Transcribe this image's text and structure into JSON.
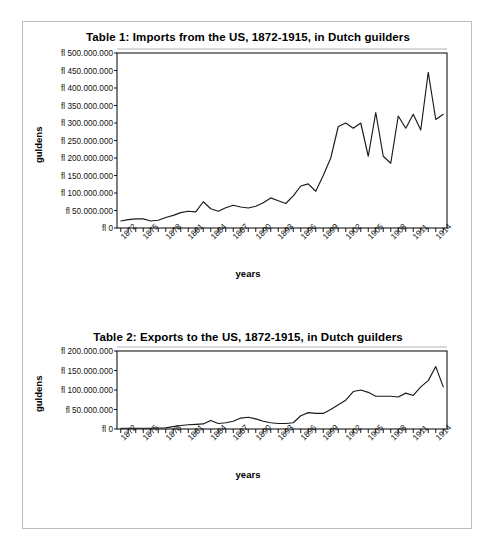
{
  "document": {
    "scan_artifact_text": "· · · ·",
    "figure_border_color": "#b9bfc6"
  },
  "charts": [
    {
      "id": "imports",
      "title": "Table 1: Imports from the US, 1872-1915, in Dutch guilders",
      "xlabel": "years",
      "ylabel": "guldens",
      "y_ticks": [
        "fl 0",
        "fl 50.000.000",
        "fl 100.000.000",
        "fl 150.000.000",
        "fl 200.000.000",
        "fl 250.000.000",
        "fl 300.000.000",
        "fl 350.000.000",
        "fl 400.000.000",
        "fl 450.000.000",
        "fl 500.000.000"
      ],
      "x_ticks": [
        "1872",
        "1875",
        "1878",
        "1881",
        "1884",
        "1887",
        "1890",
        "1893",
        "1896",
        "1899",
        "1902",
        "1905",
        "1908",
        "1911",
        "1914"
      ]
    },
    {
      "id": "exports",
      "title": "Table 2: Exports to the US, 1872-1915, in Dutch guilders",
      "xlabel": "years",
      "ylabel": "guldens",
      "y_ticks": [
        "fl 0",
        "fl 50.000.000",
        "fl 100.000.000",
        "fl 150.000.000",
        "fl 200.000.000"
      ],
      "x_ticks": [
        "1872",
        "1875",
        "1878",
        "1881",
        "1884",
        "1887",
        "1890",
        "1893",
        "1896",
        "1899",
        "1902",
        "1905",
        "1908",
        "1911",
        "1914"
      ]
    }
  ],
  "chart_data": [
    {
      "type": "line",
      "id": "imports",
      "title": "Table 1: Imports from the US, 1872-1915, in Dutch guilders",
      "xlabel": "years",
      "ylabel": "guldens",
      "currency_prefix": "fl",
      "grid": false,
      "legend": "none",
      "ylim": [
        0,
        500000000
      ],
      "ytick_step": 50000000,
      "xlim": [
        1872,
        1915
      ],
      "xtick_step": 1,
      "xtick_label_step": 3,
      "xtick_label_rotation": -45,
      "x": [
        1872,
        1873,
        1874,
        1875,
        1876,
        1877,
        1878,
        1879,
        1880,
        1881,
        1882,
        1883,
        1884,
        1885,
        1886,
        1887,
        1888,
        1889,
        1890,
        1891,
        1892,
        1893,
        1894,
        1895,
        1896,
        1897,
        1898,
        1899,
        1900,
        1901,
        1902,
        1903,
        1904,
        1905,
        1906,
        1907,
        1908,
        1909,
        1910,
        1911,
        1912,
        1913,
        1914,
        1915
      ],
      "values": [
        20000000,
        24000000,
        26000000,
        26000000,
        20000000,
        22000000,
        30000000,
        36000000,
        44000000,
        48000000,
        46000000,
        75000000,
        55000000,
        48000000,
        58000000,
        65000000,
        60000000,
        57000000,
        62000000,
        72000000,
        86000000,
        78000000,
        70000000,
        92000000,
        120000000,
        126000000,
        105000000,
        150000000,
        200000000,
        290000000,
        300000000,
        285000000,
        300000000,
        205000000,
        330000000,
        205000000,
        185000000,
        320000000,
        285000000,
        325000000,
        280000000,
        445000000,
        310000000,
        325000000
      ]
    },
    {
      "type": "line",
      "id": "exports",
      "title": "Table 2: Exports to the US, 1872-1915, in Dutch guilders",
      "xlabel": "years",
      "ylabel": "guldens",
      "currency_prefix": "fl",
      "grid": false,
      "legend": "none",
      "ylim": [
        0,
        200000000
      ],
      "ytick_step": 50000000,
      "xlim": [
        1872,
        1915
      ],
      "xtick_step": 1,
      "xtick_label_step": 3,
      "xtick_label_rotation": -45,
      "x": [
        1872,
        1873,
        1874,
        1875,
        1876,
        1877,
        1878,
        1879,
        1880,
        1881,
        1882,
        1883,
        1884,
        1885,
        1886,
        1887,
        1888,
        1889,
        1890,
        1891,
        1892,
        1893,
        1894,
        1895,
        1896,
        1897,
        1898,
        1899,
        1900,
        1901,
        1902,
        1903,
        1904,
        1905,
        1906,
        1907,
        1908,
        1909,
        1910,
        1911,
        1912,
        1913,
        1914,
        1915
      ],
      "values": [
        2000000,
        2000000,
        2000000,
        2000000,
        2000000,
        2500000,
        3000000,
        6000000,
        9000000,
        11000000,
        12000000,
        13000000,
        22000000,
        14000000,
        16000000,
        20000000,
        28000000,
        30000000,
        26000000,
        20000000,
        16000000,
        14000000,
        14000000,
        16000000,
        34000000,
        42000000,
        40000000,
        40000000,
        50000000,
        62000000,
        74000000,
        96000000,
        100000000,
        94000000,
        84000000,
        84000000,
        84000000,
        82000000,
        92000000,
        86000000,
        108000000,
        124000000,
        160000000,
        108000000
      ]
    }
  ]
}
